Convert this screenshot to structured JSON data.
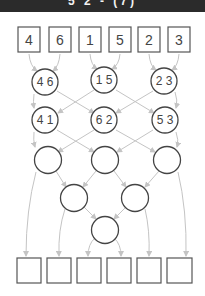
{
  "header": {
    "title": "5 2 - (7)",
    "background": "#2b2b2b"
  },
  "diagram": {
    "type": "merge-sort-tree",
    "input_boxes": [
      "4",
      "6",
      "1",
      "5",
      "2",
      "3"
    ],
    "level1_nodes": [
      "4 6",
      "1 5",
      "2 3"
    ],
    "level2_nodes": [
      "4 1",
      "6 2",
      "5 3"
    ],
    "level3_nodes": [
      "",
      "",
      ""
    ],
    "level4_nodes": [
      "",
      ""
    ],
    "level5_nodes": [
      ""
    ],
    "output_boxes": [
      "",
      "",
      "",
      "",
      "",
      ""
    ],
    "colors": {
      "arrow": "#c4c4c4",
      "stroke": "#444444"
    }
  }
}
